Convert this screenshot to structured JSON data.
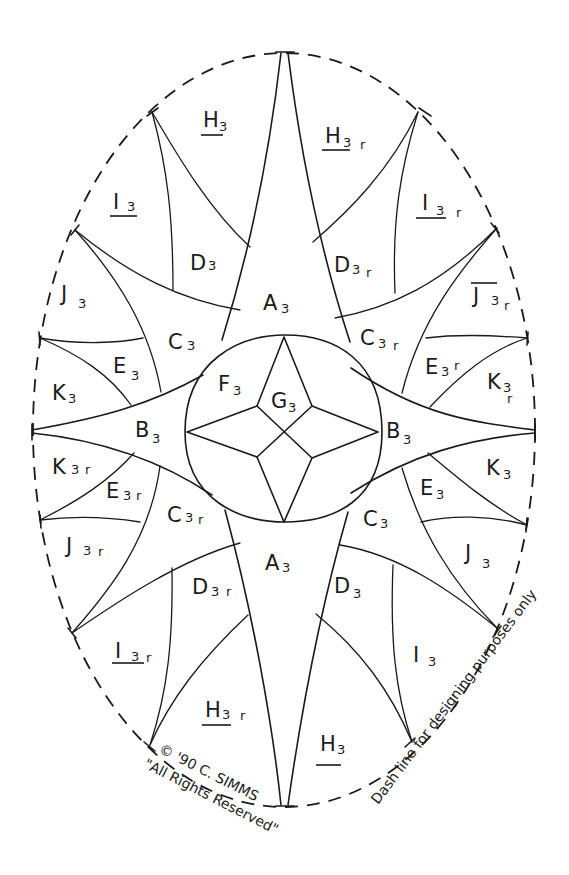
{
  "diagram": {
    "type": "quilt-pattern-template",
    "ink_color": "#1a1a1a",
    "background_color": "#ffffff"
  },
  "pieces": [
    {
      "id": "A3-top",
      "letter": "A",
      "sub": "3",
      "rev": "",
      "underline": false
    },
    {
      "id": "A3-bottom",
      "letter": "A",
      "sub": "3",
      "rev": "",
      "underline": false
    },
    {
      "id": "B3-left",
      "letter": "B",
      "sub": "3",
      "rev": "",
      "underline": false
    },
    {
      "id": "B3-right",
      "letter": "B",
      "sub": "3",
      "rev": "",
      "underline": false
    },
    {
      "id": "C3-ul",
      "letter": "C",
      "sub": "3",
      "rev": "",
      "underline": false
    },
    {
      "id": "C3r-ur",
      "letter": "C",
      "sub": "3",
      "rev": "r",
      "underline": false
    },
    {
      "id": "C3r-ll",
      "letter": "C",
      "sub": "3",
      "rev": "r",
      "underline": false
    },
    {
      "id": "C3-lr",
      "letter": "C",
      "sub": "3",
      "rev": "",
      "underline": false
    },
    {
      "id": "D3-ul",
      "letter": "D",
      "sub": "3",
      "rev": "",
      "underline": false
    },
    {
      "id": "D3r-ur",
      "letter": "D",
      "sub": "3",
      "rev": "r",
      "underline": false
    },
    {
      "id": "D3r-ll",
      "letter": "D",
      "sub": "3",
      "rev": "r",
      "underline": false
    },
    {
      "id": "D3-lr",
      "letter": "D",
      "sub": "3",
      "rev": "",
      "underline": false
    },
    {
      "id": "E3-ul",
      "letter": "E",
      "sub": "3",
      "rev": "",
      "underline": false
    },
    {
      "id": "E3r-ur",
      "letter": "E",
      "sub": "3",
      "rev": "r",
      "underline": false
    },
    {
      "id": "E3r-ll",
      "letter": "E",
      "sub": "3",
      "rev": "r",
      "underline": false
    },
    {
      "id": "E3-lr",
      "letter": "E",
      "sub": "3",
      "rev": "",
      "underline": false
    },
    {
      "id": "F3",
      "letter": "F",
      "sub": "3",
      "rev": "",
      "underline": false
    },
    {
      "id": "G3",
      "letter": "G",
      "sub": "3",
      "rev": "",
      "underline": false
    },
    {
      "id": "H3-ul",
      "letter": "H",
      "sub": "3",
      "rev": "",
      "underline": true
    },
    {
      "id": "H3r-ur",
      "letter": "H",
      "sub": "3",
      "rev": "r",
      "underline": true
    },
    {
      "id": "H3r-ll",
      "letter": "H",
      "sub": "3",
      "rev": "r",
      "underline": true
    },
    {
      "id": "H3-lr",
      "letter": "H",
      "sub": "3",
      "rev": "",
      "underline": true
    },
    {
      "id": "I3-ul",
      "letter": "I",
      "sub": "3",
      "rev": "",
      "underline": true
    },
    {
      "id": "I3r-ur",
      "letter": "I",
      "sub": "3",
      "rev": "r",
      "underline": true
    },
    {
      "id": "I3r-ll",
      "letter": "I",
      "sub": "3",
      "rev": "r",
      "underline": true
    },
    {
      "id": "I3-lr",
      "letter": "I",
      "sub": "3",
      "rev": "",
      "underline": false
    },
    {
      "id": "J3-ul",
      "letter": "J",
      "sub": "3",
      "rev": "",
      "underline": false
    },
    {
      "id": "J3r-ur",
      "letter": "J",
      "sub": "3",
      "rev": "r",
      "underline": true
    },
    {
      "id": "J3r-ll",
      "letter": "J",
      "sub": "3",
      "rev": "r",
      "underline": false
    },
    {
      "id": "J3-lr",
      "letter": "J",
      "sub": "3",
      "rev": "",
      "underline": false
    },
    {
      "id": "K3-ul",
      "letter": "K",
      "sub": "3",
      "rev": "",
      "underline": false
    },
    {
      "id": "K3r-ur",
      "letter": "K",
      "sub": "3",
      "rev": "r",
      "underline": false
    },
    {
      "id": "K3r-ll",
      "letter": "K",
      "sub": "3",
      "rev": "r",
      "underline": false
    },
    {
      "id": "K3-lr",
      "letter": "K",
      "sub": "3",
      "rev": "",
      "underline": false
    }
  ],
  "annotations": {
    "copyright_line": "© '90 C. SIMMS",
    "rights_line": "\"All Rights Reserved\"",
    "dash_note": "Dash line for designing purposes only"
  }
}
